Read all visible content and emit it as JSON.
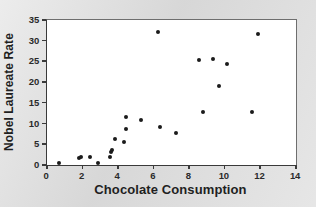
{
  "chart_data": {
    "type": "scatter",
    "title": "",
    "xlabel": "Chocolate Consumption",
    "ylabel": "Nobel Laureate Rate",
    "xlim": [
      0,
      14
    ],
    "ylim": [
      0,
      35
    ],
    "xticks": [
      0,
      2,
      4,
      6,
      8,
      10,
      12,
      14
    ],
    "yticks": [
      0,
      5,
      10,
      15,
      20,
      25,
      30,
      35
    ],
    "grid": false,
    "legend": false,
    "marker_color": "#1b1b1b",
    "plot_background": "#ffffff",
    "figure_background": "#dcdcdc",
    "points": [
      {
        "x": 0.75,
        "y": 0.2
      },
      {
        "x": 1.85,
        "y": 1.5
      },
      {
        "x": 1.95,
        "y": 1.7
      },
      {
        "x": 2.5,
        "y": 1.8
      },
      {
        "x": 2.9,
        "y": 0.2
      },
      {
        "x": 3.6,
        "y": 1.7
      },
      {
        "x": 3.65,
        "y": 3.0
      },
      {
        "x": 3.7,
        "y": 3.3
      },
      {
        "x": 3.9,
        "y": 6.0
      },
      {
        "x": 4.4,
        "y": 5.4
      },
      {
        "x": 4.5,
        "y": 8.5
      },
      {
        "x": 4.5,
        "y": 11.4
      },
      {
        "x": 5.35,
        "y": 10.7
      },
      {
        "x": 6.3,
        "y": 31.8
      },
      {
        "x": 6.4,
        "y": 9.0
      },
      {
        "x": 7.3,
        "y": 7.5
      },
      {
        "x": 8.6,
        "y": 25.2
      },
      {
        "x": 8.8,
        "y": 12.6
      },
      {
        "x": 9.4,
        "y": 25.3
      },
      {
        "x": 9.7,
        "y": 18.8
      },
      {
        "x": 10.2,
        "y": 24.2
      },
      {
        "x": 11.6,
        "y": 12.6
      },
      {
        "x": 11.9,
        "y": 31.3
      }
    ]
  }
}
